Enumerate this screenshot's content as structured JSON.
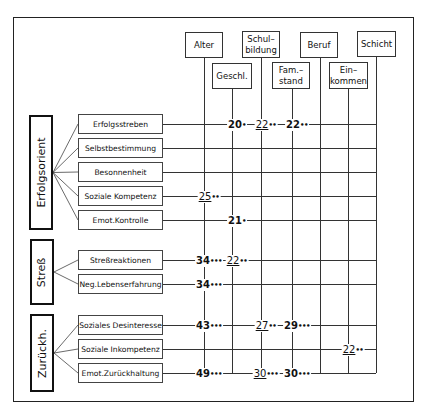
{
  "columns": [
    {
      "id": "alter",
      "label": "Alter",
      "x": 204,
      "box": [
        185,
        32,
        38,
        26
      ]
    },
    {
      "id": "geschl",
      "label": "Geschl.",
      "x": 232,
      "box": [
        212,
        63,
        40,
        26
      ]
    },
    {
      "id": "schulbildung",
      "label": "Schul–\nbildung",
      "x": 261,
      "box": [
        242,
        31,
        38,
        27
      ]
    },
    {
      "id": "famstand",
      "label": "Fam.–\nstand",
      "x": 292,
      "box": [
        272,
        62,
        38,
        27
      ]
    },
    {
      "id": "beruf",
      "label": "Beruf",
      "x": 320,
      "box": [
        300,
        32,
        38,
        26
      ]
    },
    {
      "id": "einkommen",
      "label": "Ein–\nkommen",
      "x": 348,
      "box": [
        329,
        62,
        39,
        27
      ]
    },
    {
      "id": "schicht",
      "label": "Schicht",
      "x": 376,
      "box": [
        357,
        31,
        39,
        26
      ]
    }
  ],
  "groups": [
    {
      "label": "Erfolgsorient",
      "box": [
        29,
        115,
        24,
        115
      ],
      "items": [
        {
          "label": "Erfolgsstreben",
          "y": 124,
          "values": [
            {
              "col": "geschl",
              "v": "20",
              "stars": "•",
              "u": false
            },
            {
              "col": "schulbildung",
              "v": "22",
              "stars": "••",
              "u": true
            },
            {
              "col": "famstand",
              "v": "22",
              "stars": "••",
              "u": false
            }
          ]
        },
        {
          "label": "Selbstbestimmung",
          "y": 148,
          "values": []
        },
        {
          "label": "Besonnenheit",
          "y": 172,
          "values": []
        },
        {
          "label": "Soziale Kompetenz",
          "y": 196,
          "values": [
            {
              "col": "alter",
              "v": "25",
              "stars": "••",
              "u": true
            }
          ]
        },
        {
          "label": "Emot.Kontrolle",
          "y": 220,
          "values": [
            {
              "col": "geschl",
              "v": "21",
              "stars": "•",
              "u": false
            }
          ]
        }
      ]
    },
    {
      "label": "Streß",
      "box": [
        30,
        239,
        24,
        66
      ],
      "items": [
        {
          "label": "Streßreaktionen",
          "y": 260,
          "values": [
            {
              "col": "alter",
              "v": "34",
              "stars": "•••",
              "u": false
            },
            {
              "col": "geschl",
              "v": "22",
              "stars": "••",
              "u": true
            }
          ]
        },
        {
          "label": "Neg.Lebenserfahrung",
          "y": 284,
          "values": [
            {
              "col": "alter",
              "v": "34",
              "stars": "•••",
              "u": false
            }
          ]
        }
      ]
    },
    {
      "label": "Zurückh.",
      "box": [
        30,
        314,
        24,
        78
      ],
      "items": [
        {
          "label": "Soziales Desinteresse",
          "y": 325,
          "values": [
            {
              "col": "alter",
              "v": "43",
              "stars": "•••",
              "u": false
            },
            {
              "col": "schulbildung",
              "v": "27",
              "stars": "••",
              "u": true
            },
            {
              "col": "famstand",
              "v": "29",
              "stars": "•••",
              "u": false
            }
          ]
        },
        {
          "label": "Soziale Inkompetenz",
          "y": 349,
          "values": [
            {
              "col": "einkommen",
              "v": "22",
              "stars": "••",
              "u": true
            }
          ]
        },
        {
          "label": "Emot.Zurückhaltung",
          "y": 373,
          "values": [
            {
              "col": "alter",
              "v": "49",
              "stars": "•••",
              "u": false
            },
            {
              "col": "schulbildung",
              "v": "30",
              "stars": "•••",
              "u": true
            },
            {
              "col": "famstand",
              "v": "30",
              "stars": "•••",
              "u": false
            }
          ]
        }
      ]
    }
  ],
  "layout": {
    "line_start_x": 163,
    "line_end_x": 376,
    "vline_bottom": 373
  }
}
